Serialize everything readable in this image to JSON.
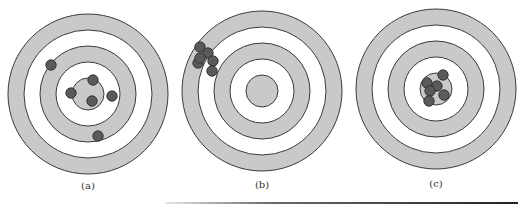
{
  "figure": {
    "colors": {
      "ring_fill": "#c9c9c9",
      "ring_gap": "#ffffff",
      "ring_stroke": "#3a3a3a",
      "dot_fill": "#5a5a5a",
      "dot_stroke": "#2e2e2e"
    },
    "ring_radii": [
      80,
      64,
      48,
      32,
      16
    ],
    "dot_radius": 5.2,
    "targets": [
      {
        "id": "a",
        "label": "(a)",
        "center": [
          88,
          94
        ],
        "label_pos": [
          88,
          180
        ],
        "hits": [
          [
            51,
            65
          ],
          [
            93,
            80
          ],
          [
            71,
            93
          ],
          [
            92,
            101
          ],
          [
            112,
            96
          ],
          [
            98,
            136
          ]
        ]
      },
      {
        "id": "b",
        "label": "(b)",
        "center": [
          262,
          91
        ],
        "label_pos": [
          262,
          179
        ],
        "hits": [
          [
            200,
            47
          ],
          [
            208,
            53
          ],
          [
            198,
            63
          ],
          [
            200,
            58
          ],
          [
            213,
            61
          ],
          [
            212,
            71
          ]
        ]
      },
      {
        "id": "c",
        "label": "(c)",
        "center": [
          436,
          89
        ],
        "label_pos": [
          436,
          178
        ],
        "hits": [
          [
            443,
            75
          ],
          [
            427,
            83
          ],
          [
            437,
            86
          ],
          [
            430,
            91
          ],
          [
            444,
            95
          ],
          [
            429,
            101
          ]
        ]
      }
    ]
  }
}
